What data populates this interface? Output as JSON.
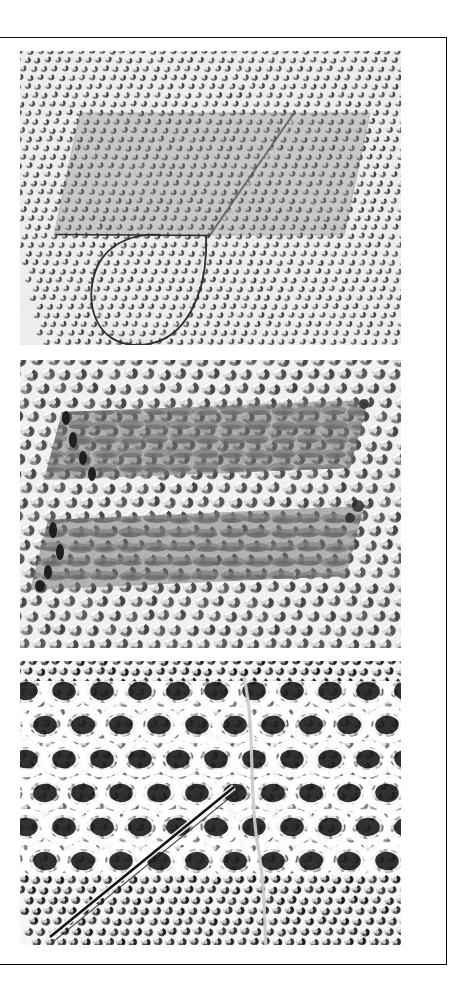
{
  "document": {
    "type": "scientific-figure",
    "title": "",
    "caption": "",
    "orientation": "portrait",
    "page_background": "#ffffff",
    "frame_color": "#0b0b0b",
    "panel_count": 3
  },
  "figure": {
    "panels": [
      {
        "id": "panel-a",
        "label": "",
        "name": "micrograph-panel-a",
        "description": "Dense hexagonal close-packed lattice with a darker rectangular terrace in the upper region, a straight horizontal step edge and a closed teardrop-shaped dislocation loop below it.",
        "modality": "scanning-probe-micrograph",
        "tone": "grayscale",
        "background_gray": "#e9e9e9",
        "lattice": {
          "type": "hexagonal",
          "spacing_px": 10.2,
          "row_pitch_px": 8.8,
          "row_shear_px": 1.9,
          "dot_rx": 4.0,
          "dot_ry": 3.4,
          "dot_fill": "#d8d8d8",
          "dot_shadow": "#3a3a3a",
          "highlight": "#fbfbfb"
        },
        "features": [
          {
            "kind": "terrace",
            "name": "dark-terrace-region",
            "shape": "parallelogram",
            "x": 60,
            "y": 62,
            "w": 290,
            "h": 122,
            "skew_px": 26,
            "overlay_gray": "#8e8e8e",
            "overlay_opacity": 0.42
          },
          {
            "kind": "step-edge",
            "name": "horizontal-step-edge",
            "shape": "line",
            "x1": 36,
            "y1": 183,
            "x2": 188,
            "y2": 184,
            "stroke": "#2b2b2b",
            "stroke_width": 1.6
          },
          {
            "kind": "step-edge",
            "name": "diagonal-step-edge",
            "shape": "line",
            "x1": 188,
            "y1": 184,
            "x2": 272,
            "y2": 63,
            "stroke": "#4a4a4a",
            "stroke_width": 1.8
          },
          {
            "kind": "dislocation-loop",
            "name": "teardrop-dislocation-loop",
            "shape": "closed-loop",
            "cx": 128,
            "cy": 240,
            "rx": 52,
            "ry": 54,
            "stroke": "#262626",
            "stroke_width": 1.7
          }
        ]
      },
      {
        "id": "panel-b",
        "label": "",
        "name": "micrograph-panel-b",
        "description": "Coarser close-packed lattice in which two wide horizontal bands appear darker; inside the bands neighbouring protrusions merge into elongated rows. Dark contrast marks terminate the bands on the left.",
        "modality": "scanning-probe-micrograph",
        "tone": "grayscale",
        "background_gray": "#efefef",
        "lattice": {
          "type": "hexagonal",
          "spacing_px": 16.5,
          "row_pitch_px": 14.2,
          "row_shear_px": 3.4,
          "dot_rx": 7.2,
          "dot_ry": 5.9,
          "dot_fill": "#d2d2d2",
          "dot_shadow": "#3f3f3f",
          "highlight": "#fdfdfd"
        },
        "features": [
          {
            "kind": "band",
            "name": "upper-dark-band",
            "shape": "parallelogram",
            "x": 42,
            "y": 52,
            "w": 306,
            "h": 68,
            "skew_px": 22,
            "overlay_gray": "#6f6f6f",
            "overlay_opacity": 0.55,
            "merged_rows": true
          },
          {
            "kind": "band",
            "name": "lower-dark-band",
            "shape": "parallelogram",
            "x": 28,
            "y": 152,
            "w": 316,
            "h": 70,
            "skew_px": 24,
            "overlay_gray": "#6f6f6f",
            "overlay_opacity": 0.55,
            "merged_rows": true
          },
          {
            "kind": "defect",
            "name": "left-band-terminations",
            "shape": "dark-blobs",
            "positions": [
              [
                45,
                58
              ],
              [
                52,
                78
              ],
              [
                62,
                96
              ],
              [
                72,
                112
              ],
              [
                30,
                168
              ],
              [
                38,
                190
              ],
              [
                50,
                208
              ],
              [
                62,
                222
              ]
            ],
            "fill": "#1d1d1d"
          }
        ]
      },
      {
        "id": "panel-c",
        "label": "",
        "name": "micrograph-panel-c",
        "description": "High-contrast reconstructed surface: bright interlinked ring/loop network occupying the central rows, bounded above and below by a finer granular close-packed lattice. A sharp dark diagonal line runs from lower left to upper right and a faint vertical domain boundary descends on the right.",
        "modality": "scanning-probe-micrograph",
        "tone": "grayscale-high-contrast",
        "background_gray": "#f7f7f7",
        "lattice": {
          "type": "hexagonal",
          "spacing_px": 12.0,
          "row_pitch_px": 10.4,
          "row_shear_px": 2.2,
          "dot_rx": 5.0,
          "dot_ry": 4.2,
          "dot_fill": "#bdbdbd",
          "dot_shadow": "#141414",
          "highlight": "#ffffff"
        },
        "features": [
          {
            "kind": "reconstruction",
            "name": "ring-network-region",
            "shape": "band",
            "x": 0,
            "y": 22,
            "w": 381,
            "h": 190,
            "ring_rx": 19,
            "ring_ry": 15,
            "ring_pitch_x": 38,
            "ring_pitch_y": 34,
            "ring_stroke": "#ffffff",
            "ring_stroke_width": 6.5,
            "core_fill": "#101010"
          },
          {
            "kind": "step-edge",
            "name": "diagonal-dark-line",
            "shape": "line",
            "x1": 32,
            "y1": 272,
            "x2": 212,
            "y2": 128,
            "stroke": "#101010",
            "stroke_width": 2.6
          },
          {
            "kind": "domain-boundary",
            "name": "vertical-domain-boundary",
            "shape": "curve",
            "x1": 226,
            "y1": 18,
            "x2": 246,
            "y2": 284,
            "stroke": "#bcbcbc",
            "stroke_width": 3.0
          }
        ]
      }
    ]
  }
}
